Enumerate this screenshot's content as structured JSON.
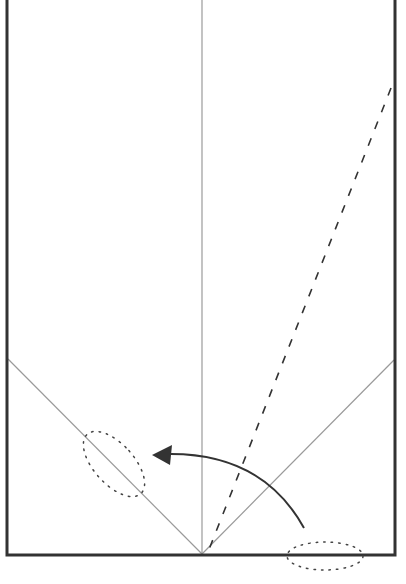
{
  "diagram": {
    "type": "origami-fold-diagram",
    "paper": {
      "x": 7,
      "y": -2,
      "width": 388,
      "height": 557,
      "stroke": "#333333",
      "stroke_width": 3
    },
    "creases": [
      {
        "name": "center-vertical-crease",
        "x1": 202,
        "y1": 0,
        "x2": 202,
        "y2": 555,
        "stroke": "#9a9a9a",
        "width": 1.2
      },
      {
        "name": "left-diagonal-crease",
        "x1": 8,
        "y1": 359,
        "x2": 202,
        "y2": 554,
        "stroke": "#9a9a9a",
        "width": 1.2
      },
      {
        "name": "right-diagonal-crease",
        "x1": 394,
        "y1": 360,
        "x2": 202,
        "y2": 554,
        "stroke": "#9a9a9a",
        "width": 1.2
      }
    ],
    "valley_fold": {
      "x1": 391,
      "y1": 88,
      "x2": 208,
      "y2": 552,
      "stroke": "#333333",
      "dash": "8 10"
    },
    "fold_arrow": {
      "path": "M 304 528 Q 262 452 166 454",
      "stroke": "#333333",
      "head": "152,455 172,445 170,465"
    },
    "markers": [
      {
        "name": "left-target-ellipse",
        "cx": 114,
        "cy": 464,
        "rx": 20,
        "ry": 40,
        "rotate": -42
      },
      {
        "name": "bottom-corner-ellipse",
        "cx": 325,
        "cy": 556,
        "rx": 38,
        "ry": 14,
        "rotate": 0
      }
    ]
  }
}
